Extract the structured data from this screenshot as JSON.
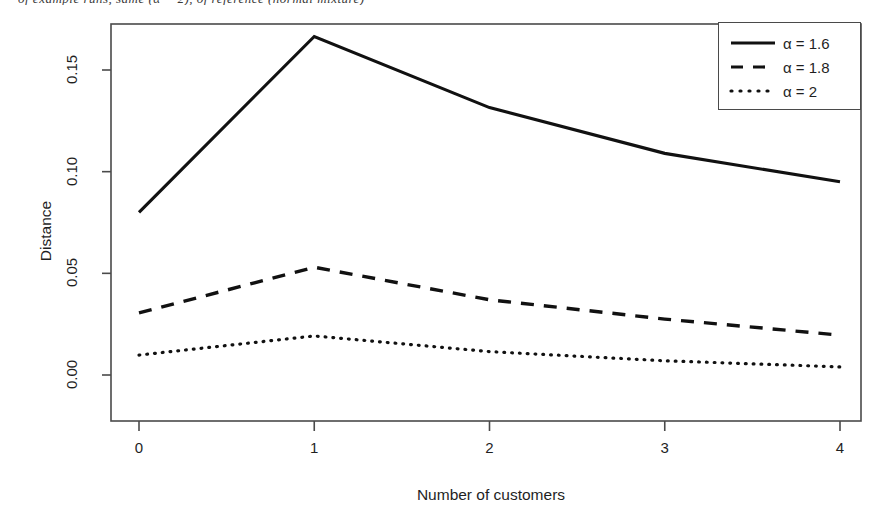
{
  "figure": {
    "clipped_caption_fragment": "of example runs, same (α = 2), of reference (normal mixture)"
  },
  "chart_data": {
    "type": "line",
    "title": "",
    "subtitle": "",
    "xlabel": "Number of customers",
    "ylabel": "Distance",
    "x": [
      0,
      1,
      2,
      3,
      4
    ],
    "xticklabels": [
      "0",
      "1",
      "2",
      "3",
      "4"
    ],
    "yticklabels": [
      "0.00",
      "0.05",
      "0.10",
      "0.15"
    ],
    "yticks": [
      0.0,
      0.05,
      0.1,
      0.15
    ],
    "xlim": [
      -0.25,
      4.25
    ],
    "ylim": [
      -0.0055,
      0.1755
    ],
    "grid": false,
    "legend_position": "top-right",
    "series": [
      {
        "name": "α = 1.6",
        "alpha": 1.6,
        "linestyle": "solid",
        "color": "#111111",
        "values": [
          0.08,
          0.1665,
          0.1315,
          0.109,
          0.095
        ]
      },
      {
        "name": "α = 1.8",
        "alpha": 1.8,
        "linestyle": "dashed",
        "color": "#111111",
        "values": [
          0.0305,
          0.053,
          0.037,
          0.0275,
          0.0196
        ]
      },
      {
        "name": "α = 2",
        "alpha": 2,
        "linestyle": "dotted",
        "color": "#111111",
        "values": [
          0.0098,
          0.0192,
          0.0115,
          0.007,
          0.004
        ]
      }
    ]
  },
  "legend": {
    "entries": [
      {
        "label": "α = 1.6",
        "style": "solid"
      },
      {
        "label": "α = 1.8",
        "style": "dashed"
      },
      {
        "label": "α = 2",
        "style": "dotted"
      }
    ]
  },
  "colors": {
    "line": "#111111",
    "frame": "#4a4a4a",
    "text": "#1f1f1f",
    "background": "#ffffff"
  }
}
